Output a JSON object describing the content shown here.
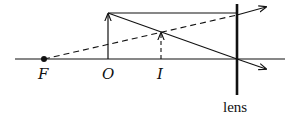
{
  "diagram": {
    "type": "ray-diagram",
    "labels": {
      "focal_point": "F",
      "object": "O",
      "image": "I",
      "lens": "lens"
    },
    "elements": [
      {
        "id": "optical-axis",
        "kind": "line",
        "style": "solid"
      },
      {
        "id": "focal-point",
        "kind": "dot",
        "label": "F"
      },
      {
        "id": "object-arrow",
        "kind": "arrow",
        "label": "O",
        "style": "solid"
      },
      {
        "id": "image-arrow",
        "kind": "arrow",
        "label": "I",
        "style": "dashed"
      },
      {
        "id": "lens",
        "kind": "thick-line",
        "label": "lens"
      },
      {
        "id": "parallel-ray",
        "kind": "ray",
        "style": "solid",
        "description": "parallel to axis, refracted away"
      },
      {
        "id": "center-ray",
        "kind": "ray",
        "style": "solid",
        "description": "through lens center, undeviated"
      },
      {
        "id": "extension-from-F",
        "kind": "line",
        "style": "dashed",
        "description": "back-extension of refracted ray through F"
      }
    ]
  }
}
